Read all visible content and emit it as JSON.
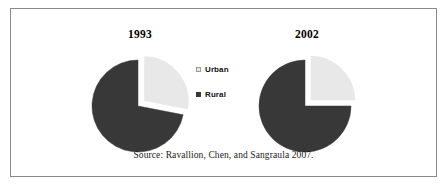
{
  "figure": {
    "source_caption": "Source: Ravallion, Chen, and Sangraula 2007.",
    "border_color": "#8a8a8a",
    "background": "#ffffff"
  },
  "legend": {
    "position": "center",
    "items": [
      {
        "label": "Urban",
        "color": "#e8e8e8",
        "swatch_name": "urban-swatch"
      },
      {
        "label": "Rural",
        "color": "#383838",
        "swatch_name": "rural-swatch"
      }
    ]
  },
  "chart_data": [
    {
      "type": "pie",
      "title": "1993",
      "categories": [
        "Urban",
        "Rural"
      ],
      "values": [
        28,
        72
      ],
      "colors": [
        "#e8e8e8",
        "#383838"
      ],
      "exploded_slice": "Urban",
      "start_angle_deg": 0,
      "urban_arc_deg": 101,
      "units": "percent"
    },
    {
      "type": "pie",
      "title": "2002",
      "categories": [
        "Urban",
        "Rural"
      ],
      "values": [
        25,
        75
      ],
      "colors": [
        "#e8e8e8",
        "#383838"
      ],
      "exploded_slice": "Urban",
      "start_angle_deg": 0,
      "urban_arc_deg": 90,
      "units": "percent"
    }
  ]
}
